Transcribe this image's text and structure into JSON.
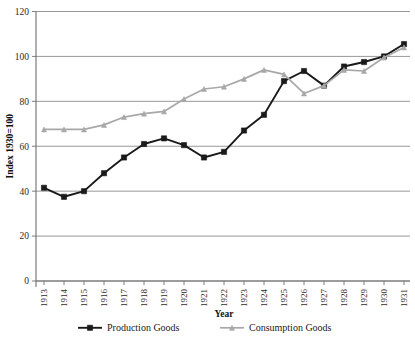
{
  "chart_data": {
    "type": "line",
    "title": "",
    "xlabel": "Year",
    "ylabel": "Index 1930=100",
    "categories": [
      "1913",
      "1914",
      "1915",
      "1916",
      "1917",
      "1918",
      "1919",
      "1920",
      "1921",
      "1922",
      "1923",
      "1924",
      "1925",
      "1926",
      "1927",
      "1928",
      "1929",
      "1930",
      "1931"
    ],
    "x": [
      1913,
      1914,
      1915,
      1916,
      1917,
      1918,
      1919,
      1920,
      1921,
      1922,
      1923,
      1924,
      1925,
      1926,
      1927,
      1928,
      1929,
      1930,
      1931
    ],
    "ylim": [
      0,
      120
    ],
    "yticks": [
      0,
      20,
      40,
      60,
      80,
      100,
      120
    ],
    "ytick_labels": [
      "0",
      "20",
      "40",
      "60",
      "80",
      "100",
      "120"
    ],
    "grid": true,
    "grid_axis": "y",
    "legend_position": "bottom",
    "series": [
      {
        "name": "Production Goods",
        "color": "#1a1a1a",
        "marker": "square",
        "values": [
          41.5,
          37.5,
          40.0,
          48.0,
          55.0,
          61.0,
          63.5,
          60.5,
          55.0,
          57.5,
          67.0,
          74.0,
          89.0,
          93.5,
          87.0,
          95.5,
          97.5,
          100.0,
          105.5
        ]
      },
      {
        "name": "Consumption Goods",
        "color": "#a8a8a8",
        "marker": "triangle",
        "values": [
          67.5,
          67.5,
          67.5,
          69.5,
          73.0,
          74.5,
          75.5,
          81.0,
          85.5,
          86.5,
          90.0,
          94.0,
          92.0,
          83.5,
          87.0,
          94.0,
          93.5,
          99.5,
          104.0
        ]
      }
    ]
  },
  "axes": {
    "y_title": "Index 1930=100",
    "x_title": "Year"
  },
  "legend": {
    "items": [
      {
        "label": "Production Goods",
        "color": "#1a1a1a",
        "marker": "square"
      },
      {
        "label": "Consumption Goods",
        "color": "#a8a8a8",
        "marker": "triangle"
      }
    ]
  }
}
